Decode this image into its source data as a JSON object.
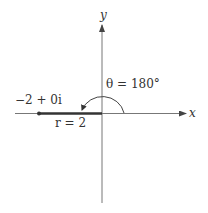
{
  "diagram": {
    "type": "complex-plane-polar",
    "axes": {
      "x_label": "x",
      "y_label": "y"
    },
    "point": {
      "label": "−2 + 0i",
      "real": -2,
      "imag": 0
    },
    "modulus": {
      "label": "r = 2",
      "value": 2
    },
    "angle": {
      "label": "θ = 180°",
      "degrees": 180
    },
    "colors": {
      "axis": "#666666",
      "segment": "#333333",
      "text": "#333333"
    }
  },
  "labels": {
    "x_axis": "x",
    "y_axis": "y",
    "point": "−2 + 0i",
    "modulus": "r = 2",
    "angle": "θ = 180°"
  }
}
